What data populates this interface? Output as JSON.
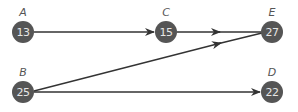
{
  "diagram": {
    "type": "directed-graph",
    "colors": {
      "node_fill": "#555555",
      "node_text": "#e6e6e6",
      "edge": "#333333",
      "label": "#555555"
    },
    "nodes": [
      {
        "id": "A",
        "label": "A",
        "value": "13",
        "x": 23,
        "y": 32
      },
      {
        "id": "C",
        "label": "C",
        "value": "15",
        "x": 166,
        "y": 32
      },
      {
        "id": "E",
        "label": "E",
        "value": "27",
        "x": 272,
        "y": 32
      },
      {
        "id": "B",
        "label": "B",
        "value": "25",
        "x": 23,
        "y": 92
      },
      {
        "id": "D",
        "label": "D",
        "value": "22",
        "x": 272,
        "y": 92
      }
    ],
    "edges": [
      {
        "from": "A",
        "to": "C"
      },
      {
        "from": "C",
        "to": "E"
      },
      {
        "from": "B",
        "to": "E"
      },
      {
        "from": "B",
        "to": "D"
      }
    ]
  }
}
